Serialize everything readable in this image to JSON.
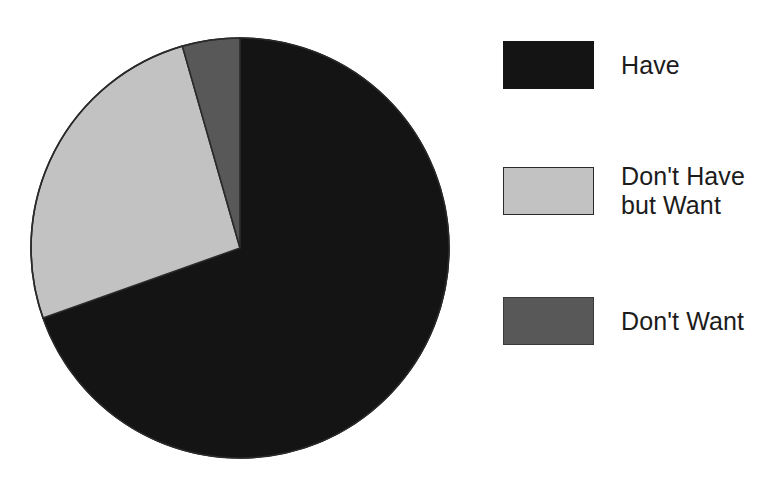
{
  "chart_data": {
    "type": "pie",
    "title": "",
    "subtitle": "",
    "xlabel": "",
    "ylabel": "",
    "grid": false,
    "legend_position": "right",
    "start_angle_deg": 0,
    "direction": "clockwise",
    "categories": [
      "Have",
      "Don't Have but Want",
      "Don't Want"
    ],
    "values": [
      69.6,
      26.0,
      4.4
    ],
    "slices": [
      {
        "label": "Have",
        "value": 69.6,
        "color": "#141414",
        "start_angle_deg": 0,
        "end_angle_deg": 250.5
      },
      {
        "label": "Don't Have but Want",
        "value": 26.0,
        "color": "#c2c2c2",
        "start_angle_deg": 250.5,
        "end_angle_deg": 344.0
      },
      {
        "label": "Don't Want",
        "value": 4.4,
        "color": "#585858",
        "start_angle_deg": 344.0,
        "end_angle_deg": 360.0
      }
    ],
    "geometry": {
      "center_x": 212,
      "center_y": 213,
      "radius_x": 209,
      "radius_y": 210,
      "outline_color": "#2a2a2a"
    }
  },
  "legend": {
    "items": [
      {
        "label": "Have",
        "label_lines": "Have",
        "swatch": "legend-swatch-have",
        "color": "#141414"
      },
      {
        "label": "Don't Have but Want",
        "label_lines": "Don't Have\nbut Want",
        "swatch": "legend-swatch-dont-have-but-want",
        "color": "#c2c2c2"
      },
      {
        "label": "Don't Want",
        "label_lines": "Don't Want",
        "swatch": "legend-swatch-dont-want",
        "color": "#585858"
      }
    ]
  }
}
